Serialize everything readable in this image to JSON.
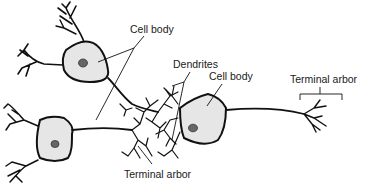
{
  "diagram": {
    "labels": {
      "cell_body_top": "Cell body",
      "dendrites": "Dendrites",
      "cell_body_right": "Cell body",
      "terminal_arbor_right": "Terminal arbor",
      "terminal_arbor_bottom": "Terminal arbor"
    },
    "colors": {
      "cell_fill": "#e6e6e6",
      "nucleus": "#666666",
      "line": "#111111"
    }
  }
}
